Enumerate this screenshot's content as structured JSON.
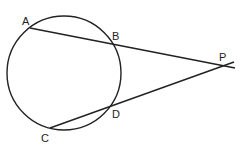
{
  "diagram": {
    "circle": {
      "cx": 64,
      "cy": 73,
      "r": 57
    },
    "colors": {
      "stroke": "#222222",
      "background": "#ffffff"
    },
    "points": {
      "A": {
        "label": "A",
        "x": 30,
        "y": 28
      },
      "B": {
        "label": "B",
        "x": 111,
        "y": 43
      },
      "C": {
        "label": "C",
        "x": 50,
        "y": 128
      },
      "D": {
        "label": "D",
        "x": 110,
        "y": 107
      },
      "P": {
        "label": "P",
        "x": 222,
        "y": 65
      }
    },
    "segments": [
      {
        "name": "secant-APB",
        "from": "A",
        "through": "B",
        "to": "P"
      },
      {
        "name": "secant-CPD",
        "from": "C",
        "through": "D",
        "to": "P"
      }
    ]
  }
}
